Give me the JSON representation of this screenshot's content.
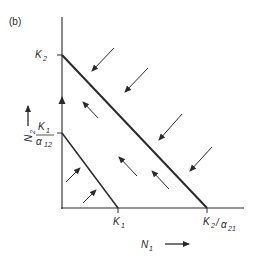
{
  "panel_label": "(b)",
  "axes": {
    "x_label": "N",
    "x_label_sub": "1",
    "y_label": "N",
    "y_label_sub": "2"
  },
  "ticks": {
    "y_top": {
      "main": "K",
      "sub": "2"
    },
    "y_low_num": {
      "main": "K",
      "sub": "1"
    },
    "y_low_den": {
      "main": "α",
      "sub": "12"
    },
    "x_left": {
      "main": "K",
      "sub": "1"
    },
    "x_right_num": {
      "main": "K",
      "sub": "2"
    },
    "x_right_den": {
      "main": "α",
      "sub": "21"
    }
  },
  "isoclines": [
    {
      "name": "N2 isocline",
      "from": "K2",
      "to": "K2/α21"
    },
    {
      "name": "N1 isocline",
      "from": "K1/α12",
      "to": "K1"
    }
  ],
  "colors": {
    "ink": "#2a2a2a",
    "background": "#ffffff"
  }
}
